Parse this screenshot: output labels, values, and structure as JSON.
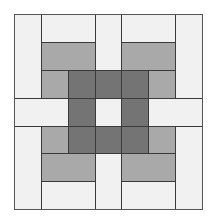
{
  "diagram": {
    "type": "quilt-block-pattern",
    "grid": {
      "cols": 7,
      "rows": 7
    },
    "colors": {
      "light": "#f1f1f1",
      "medium": "#a9a9a9",
      "dark": "#747474",
      "line": "#3a3a3a"
    },
    "origin": {
      "x": 14,
      "y": 14
    },
    "col_edges": [
      14,
      41,
      68,
      95,
      121,
      148,
      175,
      202
    ],
    "row_edges": [
      14,
      42,
      70,
      98,
      126,
      153,
      181,
      209
    ],
    "pieces": [
      {
        "c": 0,
        "r": 0,
        "w": 1,
        "h": 3,
        "tone": "light"
      },
      {
        "c": 1,
        "r": 0,
        "w": 2,
        "h": 1,
        "tone": "light"
      },
      {
        "c": 3,
        "r": 0,
        "w": 1,
        "h": 2,
        "tone": "light"
      },
      {
        "c": 4,
        "r": 0,
        "w": 2,
        "h": 1,
        "tone": "light"
      },
      {
        "c": 6,
        "r": 0,
        "w": 1,
        "h": 3,
        "tone": "light"
      },
      {
        "c": 1,
        "r": 1,
        "w": 2,
        "h": 1,
        "tone": "medium"
      },
      {
        "c": 4,
        "r": 1,
        "w": 2,
        "h": 1,
        "tone": "medium"
      },
      {
        "c": 1,
        "r": 2,
        "w": 1,
        "h": 1,
        "tone": "medium"
      },
      {
        "c": 2,
        "r": 2,
        "w": 1,
        "h": 1,
        "tone": "dark"
      },
      {
        "c": 3,
        "r": 2,
        "w": 1,
        "h": 1,
        "tone": "dark"
      },
      {
        "c": 4,
        "r": 2,
        "w": 1,
        "h": 1,
        "tone": "dark"
      },
      {
        "c": 5,
        "r": 2,
        "w": 1,
        "h": 1,
        "tone": "medium"
      },
      {
        "c": 0,
        "r": 3,
        "w": 2,
        "h": 1,
        "tone": "light"
      },
      {
        "c": 2,
        "r": 3,
        "w": 1,
        "h": 1,
        "tone": "dark"
      },
      {
        "c": 3,
        "r": 3,
        "w": 1,
        "h": 1,
        "tone": "light"
      },
      {
        "c": 4,
        "r": 3,
        "w": 1,
        "h": 1,
        "tone": "dark"
      },
      {
        "c": 5,
        "r": 3,
        "w": 2,
        "h": 1,
        "tone": "light"
      },
      {
        "c": 0,
        "r": 4,
        "w": 1,
        "h": 3,
        "tone": "light"
      },
      {
        "c": 1,
        "r": 4,
        "w": 1,
        "h": 1,
        "tone": "medium"
      },
      {
        "c": 2,
        "r": 4,
        "w": 1,
        "h": 1,
        "tone": "dark"
      },
      {
        "c": 3,
        "r": 4,
        "w": 1,
        "h": 1,
        "tone": "dark"
      },
      {
        "c": 4,
        "r": 4,
        "w": 1,
        "h": 1,
        "tone": "dark"
      },
      {
        "c": 5,
        "r": 4,
        "w": 1,
        "h": 1,
        "tone": "medium"
      },
      {
        "c": 6,
        "r": 4,
        "w": 1,
        "h": 3,
        "tone": "light"
      },
      {
        "c": 1,
        "r": 5,
        "w": 2,
        "h": 1,
        "tone": "medium"
      },
      {
        "c": 3,
        "r": 5,
        "w": 1,
        "h": 2,
        "tone": "light"
      },
      {
        "c": 4,
        "r": 5,
        "w": 2,
        "h": 1,
        "tone": "medium"
      },
      {
        "c": 1,
        "r": 6,
        "w": 2,
        "h": 1,
        "tone": "light"
      },
      {
        "c": 4,
        "r": 6,
        "w": 2,
        "h": 1,
        "tone": "light"
      }
    ]
  }
}
